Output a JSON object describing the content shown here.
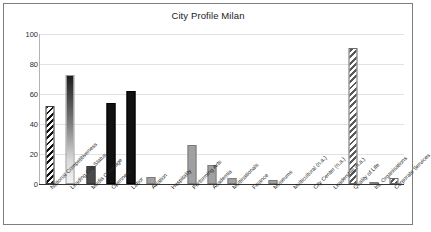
{
  "chart_data": {
    "type": "bar",
    "title": "City Profile Milan",
    "xlabel": "",
    "ylabel": "",
    "ylim": [
      0,
      100
    ],
    "yticks": [
      0,
      20,
      40,
      60,
      80,
      100
    ],
    "grid": true,
    "legend": "none",
    "categories": [
      "National Competitiveness",
      "Leading City Status",
      "Media Coverage",
      "Openness",
      "Labor",
      "Aviation",
      "Hospitality",
      "Performing Arts",
      "Academia",
      "Multinationals",
      "Finance",
      "Museums",
      "Multicultural (n.a.)",
      "City Center (n.a.)",
      "Leadership (n.a.)",
      "Quality of Life",
      "Int. Organisations",
      "Corporate Services"
    ],
    "values": [
      52,
      73,
      12,
      54,
      62,
      5,
      0,
      26,
      13,
      4,
      0,
      3,
      0,
      0,
      0,
      91,
      1,
      4
    ],
    "bar_styles": [
      "hatch",
      "gradient",
      "darkgray",
      "black",
      "black",
      "gray",
      "gray",
      "gray",
      "gray",
      "gray",
      "gray",
      "gray",
      "gray",
      "gray",
      "gray",
      "hatch-gray",
      "gray",
      "hatch-gray"
    ]
  },
  "colors": {
    "frame": "#7d7d7d",
    "grid": "#e2e2e2",
    "axis": "#333333",
    "text": "#1a1a1a",
    "bar_black": "#111111",
    "bar_gray": "#a0a0a0",
    "bar_darkgray": "#4b4b4b"
  }
}
